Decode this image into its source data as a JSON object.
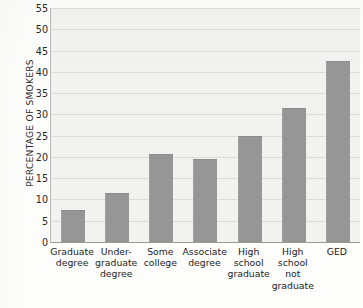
{
  "chart_data": {
    "type": "bar",
    "title": "",
    "xlabel": "",
    "ylabel": "PERCENTAGE OF SMOKERS",
    "ylim": [
      0,
      55
    ],
    "ytick_step": 5,
    "grid": true,
    "legend": "none",
    "bar_color": "#969696",
    "plot_background": "#f2f2f0",
    "categories": [
      "Graduate degree",
      "Under-graduate degree",
      "Some college",
      "Associate degree",
      "High school graduate",
      "High school not graduate",
      "GED"
    ],
    "category_label_lines": [
      [
        "Graduate",
        "degree"
      ],
      [
        "Under-",
        "graduate",
        "degree"
      ],
      [
        "Some",
        "college"
      ],
      [
        "Associate",
        "degree"
      ],
      [
        "High",
        "school",
        "graduate"
      ],
      [
        "High",
        "school",
        "not",
        "graduate"
      ],
      [
        "GED"
      ]
    ],
    "values": [
      7.5,
      11.5,
      20.8,
      19.5,
      25.0,
      31.5,
      42.5
    ],
    "ytick_labels": [
      "0",
      "5",
      "10",
      "15",
      "20",
      "25",
      "30",
      "35",
      "40",
      "45",
      "50",
      "55"
    ],
    "ytick_values": [
      0,
      5,
      10,
      15,
      20,
      25,
      30,
      35,
      40,
      45,
      50,
      55
    ]
  }
}
